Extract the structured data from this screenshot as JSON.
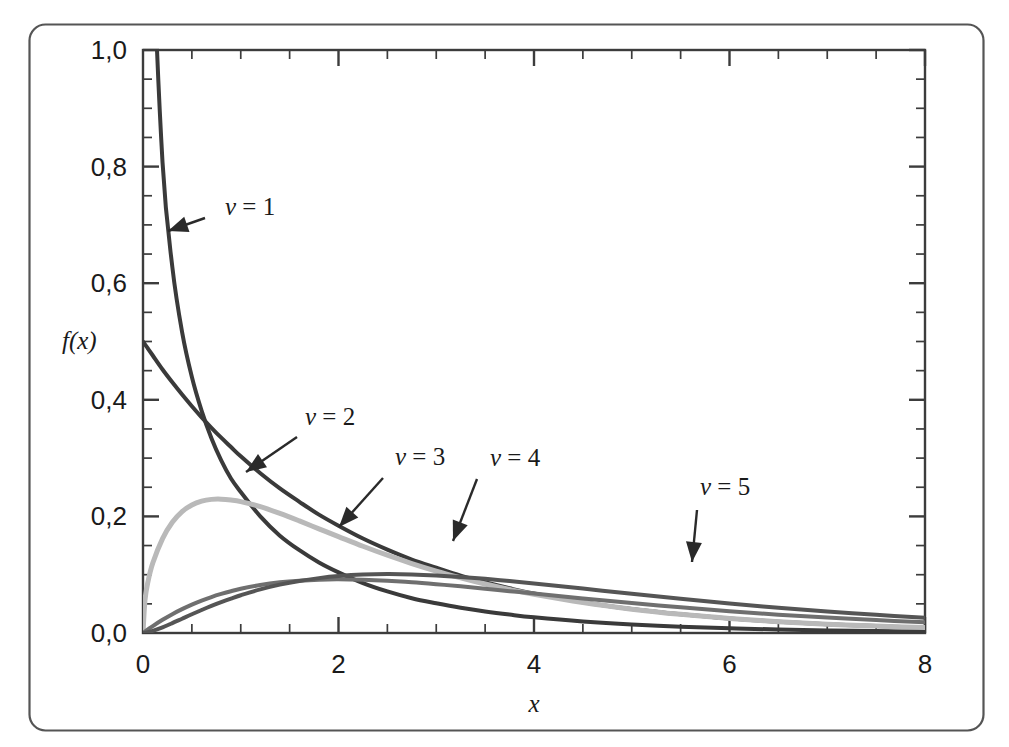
{
  "figure": {
    "border_color": "#4a4a4a",
    "background": "#ffffff"
  },
  "axes": {
    "x_title": "x",
    "y_title": "f(x)",
    "x_tick_labels": [
      "0",
      "2",
      "4",
      "6",
      "8"
    ],
    "y_tick_labels": [
      "0,0",
      "0,2",
      "0,4",
      "0,6",
      "0,8",
      "1,0"
    ]
  },
  "chart_data": {
    "type": "line",
    "title": "",
    "subtitle": "",
    "xlabel": "x",
    "ylabel": "f(x)",
    "xlim": [
      0,
      8
    ],
    "ylim": [
      0,
      1.0
    ],
    "xticks": [
      0,
      2,
      4,
      6,
      8
    ],
    "yticks": [
      0.0,
      0.2,
      0.4,
      0.6,
      0.8,
      1.0
    ],
    "x_minor_tick_step": 0.5,
    "y_minor_tick_step": 0.05,
    "grid": false,
    "legend": "inline-annotations",
    "x": [
      0.02,
      0.05,
      0.1,
      0.2,
      0.3,
      0.4,
      0.5,
      0.6,
      0.7,
      0.8,
      0.9,
      1.0,
      1.2,
      1.4,
      1.6,
      1.8,
      2.0,
      2.25,
      2.5,
      2.75,
      3.0,
      3.25,
      3.5,
      3.75,
      4.0,
      4.5,
      5.0,
      5.5,
      6.0,
      6.5,
      7.0,
      7.5,
      8.0
    ],
    "series": [
      {
        "name": "nu = 1",
        "label": "ν = 1",
        "color": "#3a3a3a",
        "linewidth": 4,
        "values": [
          2.797,
          1.753,
          1.2,
          0.807,
          0.628,
          0.516,
          0.439,
          0.381,
          0.334,
          0.296,
          0.265,
          0.242,
          0.2,
          0.167,
          0.142,
          0.121,
          0.104,
          0.0857,
          0.0713,
          0.0597,
          0.051,
          0.0433,
          0.0369,
          0.0316,
          0.027,
          0.0199,
          0.0146,
          0.0108,
          0.0081,
          0.006,
          0.0045,
          0.0034,
          0.0025
        ]
      },
      {
        "name": "nu = 2",
        "label": "ν = 2",
        "color": "#3a3a3a",
        "linewidth": 4,
        "values": [
          0.495,
          0.488,
          0.476,
          0.452,
          0.43,
          0.409,
          0.389,
          0.37,
          0.352,
          0.335,
          0.319,
          0.303,
          0.274,
          0.248,
          0.225,
          0.203,
          0.184,
          0.162,
          0.143,
          0.126,
          0.112,
          0.0985,
          0.087,
          0.0767,
          0.0677,
          0.0527,
          0.041,
          0.032,
          0.0249,
          0.0194,
          0.0151,
          0.0118,
          0.0092
        ]
      },
      {
        "name": "nu = 3",
        "label": "ν = 3",
        "color": "#b9b9b9",
        "linewidth": 5,
        "values": [
          0.0561,
          0.0873,
          0.12,
          0.162,
          0.19,
          0.2083,
          0.2196,
          0.2262,
          0.2292,
          0.2296,
          0.2281,
          0.2254,
          0.2167,
          0.2051,
          0.1922,
          0.1787,
          0.1654,
          0.1488,
          0.1334,
          0.1192,
          0.1063,
          0.0947,
          0.0841,
          0.0747,
          0.0663,
          0.0522,
          0.0409,
          0.032,
          0.025,
          0.0195,
          0.0152,
          0.0119,
          0.0093
        ]
      },
      {
        "name": "nu = 4",
        "label": "ν = 4",
        "color": "#6f6f6f",
        "linewidth": 4,
        "values": [
          0.0025,
          0.0061,
          0.0119,
          0.0226,
          0.0323,
          0.0409,
          0.0487,
          0.0556,
          0.0617,
          0.067,
          0.0717,
          0.0758,
          0.0823,
          0.0869,
          0.0898,
          0.0915,
          0.092,
          0.0912,
          0.0895,
          0.087,
          0.0837,
          0.08,
          0.076,
          0.0718,
          0.0677,
          0.0593,
          0.0513,
          0.044,
          0.0373,
          0.0315,
          0.0265,
          0.0221,
          0.0183
        ]
      },
      {
        "name": "nu = 5",
        "label": "ν = 5",
        "color": "#555555",
        "linewidth": 4,
        "values": [
          0.0003,
          0.0013,
          0.0036,
          0.0097,
          0.0169,
          0.0245,
          0.0321,
          0.0394,
          0.0464,
          0.053,
          0.0591,
          0.0648,
          0.0748,
          0.0829,
          0.0893,
          0.0941,
          0.0976,
          0.1002,
          0.1011,
          0.1005,
          0.0988,
          0.0962,
          0.0929,
          0.0891,
          0.085,
          0.0762,
          0.0673,
          0.0587,
          0.0506,
          0.0433,
          0.0368,
          0.0311,
          0.0262
        ]
      }
    ]
  },
  "annotations": [
    {
      "name": "nu-1",
      "label": "ν = 1",
      "text_x": 225,
      "text_y": 215,
      "arrow_from": [
        205,
        218
      ],
      "arrow_to": [
        168,
        231
      ]
    },
    {
      "name": "nu-2",
      "label": "ν = 2",
      "text_x": 305,
      "text_y": 425,
      "arrow_from": [
        297,
        437
      ],
      "arrow_to": [
        246,
        472
      ]
    },
    {
      "name": "nu-3",
      "label": "ν = 3",
      "text_x": 395,
      "text_y": 465,
      "arrow_from": [
        383,
        478
      ],
      "arrow_to": [
        339,
        527
      ]
    },
    {
      "name": "nu-4",
      "label": "ν = 4",
      "text_x": 490,
      "text_y": 466,
      "arrow_from": [
        477,
        479
      ],
      "arrow_to": [
        453,
        541
      ]
    },
    {
      "name": "nu-5",
      "label": "ν = 5",
      "text_x": 700,
      "text_y": 495,
      "arrow_from": [
        697,
        510
      ],
      "arrow_to": [
        692,
        562
      ]
    }
  ]
}
